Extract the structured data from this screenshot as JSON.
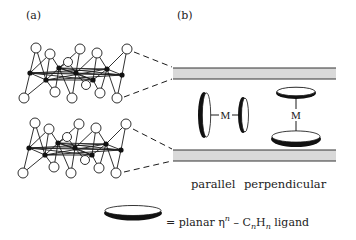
{
  "panels": {
    "a": {
      "label": "(a)"
    },
    "b": {
      "label": "(b)"
    }
  },
  "orientations": {
    "parallel": {
      "label": "parallel",
      "metal": "M"
    },
    "perpendicular": {
      "label": "perpendicular",
      "metal": "M"
    }
  },
  "legend": {
    "prefix": "= planar η",
    "sup": "n",
    "dash": " – C",
    "sub1": "n",
    "h": "H",
    "sub2": "n",
    "suffix": " ligand"
  },
  "colors": {
    "stroke": "#1a1a1a",
    "surface": "#d9d9d9",
    "background": "#ffffff"
  }
}
